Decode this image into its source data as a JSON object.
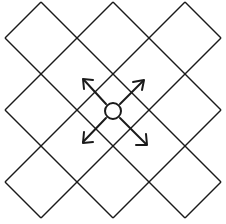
{
  "diagram": {
    "colors": {
      "background": "#ffffff",
      "stroke": "#1a1a1a"
    },
    "grid": {
      "type": "diamond-lattice",
      "columns": 3,
      "rows": 3,
      "top_vertices_x": [
        41,
        113,
        185
      ],
      "side_vertices_y": [
        38,
        110,
        182
      ],
      "spacing": 36
    },
    "node": {
      "shape": "circle",
      "cx": 113,
      "cy": 111,
      "r": 8
    },
    "arrows": [
      {
        "name": "arrow-up-left",
        "direction": "up-left"
      },
      {
        "name": "arrow-up-right",
        "direction": "up-right"
      },
      {
        "name": "arrow-down-left",
        "direction": "down-left"
      },
      {
        "name": "arrow-down-right",
        "direction": "down-right"
      }
    ]
  }
}
